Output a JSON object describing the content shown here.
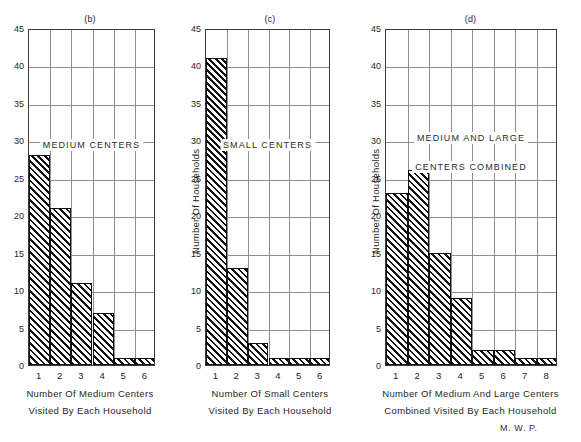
{
  "figure": {
    "signature": "M. W. P.",
    "axis_color": "#3a3a3a",
    "grid_color": "#8e8e8e",
    "bar_color": "#111111",
    "background": "#ffffff"
  },
  "chart_data": [
    {
      "type": "bar",
      "panel": "(b)",
      "title": "(b)",
      "annotations": [
        "MEDIUM CENTERS"
      ],
      "categories": [
        "1",
        "2",
        "3",
        "4",
        "5",
        "6"
      ],
      "values": [
        28,
        21,
        11,
        7,
        1,
        1
      ],
      "ylabel": "",
      "xlabel": "Number Of Medium Centers Visited By Each Household",
      "xlabel_lines": [
        "Number Of Medium Centers",
        "Visited By Each Household"
      ],
      "ylim": [
        0,
        45
      ],
      "yticks": [
        0,
        5,
        10,
        15,
        20,
        25,
        30,
        35,
        40,
        45
      ],
      "ytick_labels": [
        "0",
        "5",
        "10",
        "15",
        "20",
        "25",
        "30",
        "35",
        "40",
        "45"
      ],
      "grid": true,
      "legend": "none",
      "fill": "diagonal-hatch"
    },
    {
      "type": "bar",
      "panel": "(c)",
      "title": "(c)",
      "annotations": [
        "SMALL CENTERS"
      ],
      "categories": [
        "1",
        "2",
        "3",
        "4",
        "5",
        "6"
      ],
      "values": [
        41,
        13,
        3,
        1,
        1,
        1
      ],
      "ylabel": "Number Of Households",
      "xlabel": "Number Of Small Centers Visited By Each Household",
      "xlabel_lines": [
        "Number Of Small Centers",
        "Visited By Each Household"
      ],
      "ylim": [
        0,
        45
      ],
      "yticks": [
        0,
        5,
        10,
        15,
        20,
        25,
        30,
        35,
        40,
        45
      ],
      "ytick_labels": [
        "0",
        "5",
        "10",
        "15",
        "20",
        "25",
        "30",
        "35",
        "40",
        "45"
      ],
      "grid": true,
      "legend": "none",
      "fill": "diagonal-hatch"
    },
    {
      "type": "bar",
      "panel": "(d)",
      "title": "(d)",
      "annotations": [
        "MEDIUM AND LARGE",
        "CENTERS COMBINED"
      ],
      "categories": [
        "1",
        "2",
        "3",
        "4",
        "5",
        "6",
        "7",
        "8"
      ],
      "values": [
        23,
        26,
        15,
        9,
        2,
        2,
        1,
        1
      ],
      "ylabel": "Number Of Households",
      "xlabel": "Number Of Medium And Large Centers Combined Visited By Each Household",
      "xlabel_lines": [
        "Number Of Medium And Large Centers",
        "Combined Visited By Each Household"
      ],
      "ylim": [
        0,
        45
      ],
      "yticks": [
        0,
        5,
        10,
        15,
        20,
        25,
        30,
        35,
        40,
        45
      ],
      "ytick_labels": [
        "0",
        "5",
        "10",
        "15",
        "20",
        "25",
        "30",
        "35",
        "40",
        "45"
      ],
      "grid": true,
      "legend": "none",
      "fill": "diagonal-hatch"
    }
  ]
}
